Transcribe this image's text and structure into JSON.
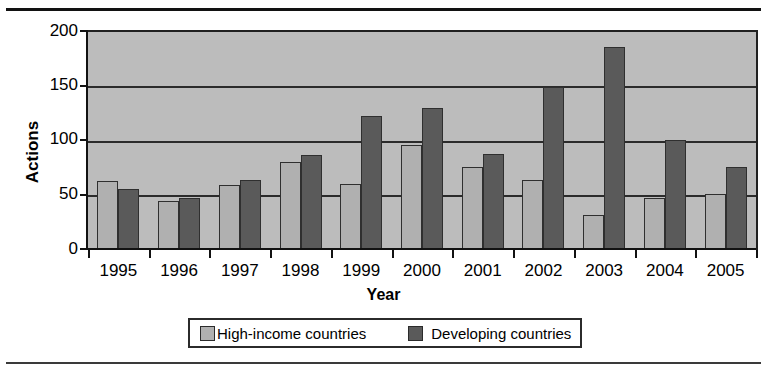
{
  "chart_data": {
    "type": "bar",
    "title": "",
    "xlabel": "Year",
    "ylabel": "Actions",
    "ylim": [
      0,
      200
    ],
    "yticks": [
      0,
      50,
      100,
      150,
      200
    ],
    "grid": true,
    "legend_position": "bottom",
    "categories": [
      "1995",
      "1996",
      "1997",
      "1998",
      "1999",
      "2000",
      "2001",
      "2002",
      "2003",
      "2004",
      "2005"
    ],
    "series": [
      {
        "name": "High-income countries",
        "color": "#b0b0b0",
        "values": [
          63,
          45,
          60,
          81,
          61,
          96,
          76,
          64,
          32,
          48,
          51
        ]
      },
      {
        "name": "Developing countries",
        "color": "#5a5a5a",
        "values": [
          56,
          48,
          64,
          87,
          123,
          130,
          88,
          150,
          186,
          101,
          76
        ]
      }
    ]
  },
  "axes": {
    "ylabel": "Actions",
    "xlabel": "Year",
    "ytick_labels": [
      "200",
      "150",
      "100",
      "50",
      "0"
    ],
    "xtick_labels": [
      "1995",
      "1996",
      "1997",
      "1998",
      "1999",
      "2000",
      "2001",
      "2002",
      "2003",
      "2004",
      "2005"
    ]
  },
  "legend": {
    "items": [
      {
        "label": "High-income countries",
        "swatch": "light-gray-swatch-icon"
      },
      {
        "label": "Developing countries",
        "swatch": "dark-gray-swatch-icon"
      }
    ]
  },
  "colors": {
    "plot_background": "#bcbcbc",
    "series_light": "#b0b0b0",
    "series_dark": "#5a5a5a",
    "axis": "#121212"
  }
}
